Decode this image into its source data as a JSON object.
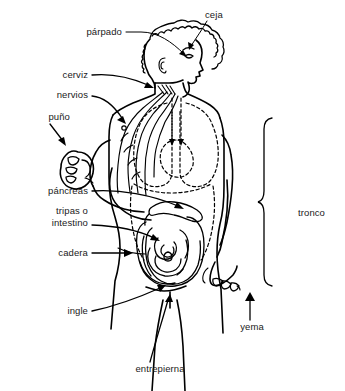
{
  "image": {
    "title": "Diagrama anatómico del cuerpo humano",
    "background_color": "#ffffff",
    "line_color": "#000000",
    "text_color": "#1a1a1a",
    "language": "es",
    "width": 345,
    "height": 391
  },
  "labels": {
    "parpado": "párpado",
    "ceja": "ceja",
    "cerviz": "cerviz",
    "nervios": "nervios",
    "puno": "puño",
    "pancreas": "páncreas",
    "tripas_line1": "tripas o",
    "tripas_line2": "intestino",
    "cadera": "cadera",
    "ingle": "ingle",
    "entrepierna": "entrepierna",
    "yema": "yema",
    "tronco": "tronco"
  },
  "callouts": [
    {
      "name": "parpado",
      "label": "párpado",
      "side": "left",
      "pointer": "line",
      "target": "ojo / párpado"
    },
    {
      "name": "ceja",
      "label": "ceja",
      "side": "right",
      "pointer": "line",
      "target": "ceja"
    },
    {
      "name": "cerviz",
      "label": "cerviz",
      "side": "left",
      "pointer": "arrow",
      "target": "cuello"
    },
    {
      "name": "nervios",
      "label": "nervios",
      "side": "left",
      "pointer": "arrow",
      "target": "hombro / nervios"
    },
    {
      "name": "puno",
      "label": "puño",
      "side": "left",
      "pointer": "arrow",
      "target": "mano cerrada"
    },
    {
      "name": "pancreas",
      "label": "páncreas",
      "side": "left",
      "pointer": "arrow",
      "target": "páncreas"
    },
    {
      "name": "tripas",
      "label": "tripas o intestino",
      "side": "left",
      "pointer": "arrow",
      "target": "intestino"
    },
    {
      "name": "cadera",
      "label": "cadera",
      "side": "left",
      "pointer": "arrow",
      "target": "cadera"
    },
    {
      "name": "ingle",
      "label": "ingle",
      "side": "left",
      "pointer": "arrow",
      "target": "ingle"
    },
    {
      "name": "entrepierna",
      "label": "entrepierna",
      "side": "bottom",
      "pointer": "arrow",
      "target": "entrepierna"
    },
    {
      "name": "yema",
      "label": "yema",
      "side": "bottom",
      "pointer": "arrow",
      "target": "yema del dedo"
    },
    {
      "name": "tronco",
      "label": "tronco",
      "side": "right",
      "pointer": "brace",
      "target": "tronco"
    }
  ]
}
